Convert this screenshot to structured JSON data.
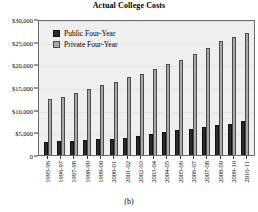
{
  "figure": {
    "caption": "(b)"
  },
  "chart_data": {
    "type": "bar",
    "title": "Actual College Costs",
    "xlabel": "",
    "ylabel": "",
    "ylim": [
      0,
      30000
    ],
    "yticks": [
      0,
      5000,
      10000,
      15000,
      20000,
      25000,
      30000
    ],
    "ytick_labels": [
      "0",
      "$5,000",
      "$10,000",
      "$15,000",
      "$20,000",
      "$25,000",
      "$30,000"
    ],
    "grid": true,
    "legend_position": "upper-left-inside",
    "categories": [
      "1995-96",
      "1996-97",
      "1997-98",
      "1998-99",
      "1999-00",
      "2000-01",
      "2001-02",
      "2002-03",
      "2003-04",
      "2004-05",
      "2005-06",
      "2006-07",
      "2007-08",
      "2008-09",
      "2009-10",
      "2010-11"
    ],
    "series": [
      {
        "name": "Public Four-Year",
        "color": "#2a2a2a",
        "values": [
          2850,
          3050,
          3200,
          3350,
          3450,
          3550,
          3850,
          4150,
          4600,
          5100,
          5500,
          5800,
          6200,
          6550,
          6900,
          7600
        ]
      },
      {
        "name": "Private Four-Year",
        "color": "#a8a8a8",
        "values": [
          12250,
          12900,
          13650,
          14500,
          15400,
          16100,
          17250,
          17950,
          18900,
          20100,
          20900,
          22200,
          23650,
          25050,
          26000,
          27000
        ]
      }
    ]
  }
}
